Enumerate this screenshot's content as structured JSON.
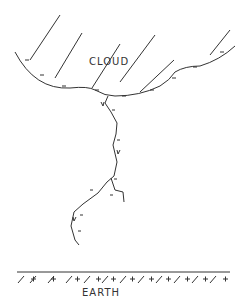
{
  "diagram": {
    "cloud_label": "CLOUD",
    "earth_label": "EARTH",
    "cloud_charge": "-",
    "earth_charge": "+",
    "colors": {
      "line": "#333333",
      "background": "#ffffff"
    }
  }
}
